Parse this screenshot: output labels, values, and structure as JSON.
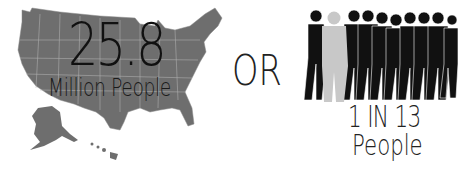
{
  "left_stat": {
    "number": "25.8",
    "unit": "Million People",
    "graphic": "us-map"
  },
  "separator": "OR",
  "right_stat": {
    "ratio": "1 IN 13",
    "unit": "People",
    "graphic": "crowd-silhouettes"
  },
  "colors": {
    "map_fill": "#6e6e6e",
    "map_lines": "#bdbdbd",
    "silhouette": "#111111",
    "highlight_silhouette": "#c8c8c8",
    "text": "#1a1a1a"
  }
}
